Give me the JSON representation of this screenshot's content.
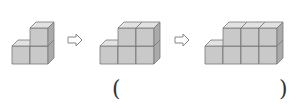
{
  "diagram": {
    "colors": {
      "front": "#c9c9c9",
      "top": "#e2e2e2",
      "side": "#aaaaaa",
      "edge": "#7a7a7a",
      "arrow": "#888888"
    },
    "figures": [
      {
        "name": "figure-1",
        "ox": 12,
        "bottom_cols": 2,
        "top_cols": [
          1
        ]
      },
      {
        "name": "figure-2",
        "ox": 100,
        "bottom_cols": 3,
        "top_cols": [
          1,
          2
        ]
      },
      {
        "name": "figure-3",
        "ox": 205,
        "bottom_cols": 4,
        "top_cols": [
          1,
          2,
          3
        ]
      }
    ],
    "arrows": [
      {
        "x": 68
      },
      {
        "x": 175
      }
    ],
    "answer": {
      "open": "(",
      "close": ")",
      "value": ""
    }
  }
}
